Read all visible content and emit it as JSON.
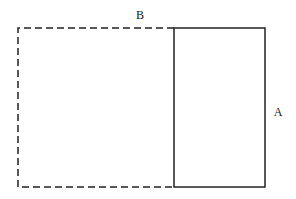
{
  "diagram": {
    "labels": {
      "top": "B",
      "right": "A"
    },
    "stroke_color": "#222222",
    "background": "#ffffff",
    "shapes": [
      {
        "id": "dashed-rectangle",
        "style": "dashed",
        "x1": 18,
        "y1": 28,
        "x2": 174,
        "y2": 187
      },
      {
        "id": "solid-rectangle",
        "style": "solid",
        "x1": 174,
        "y1": 28,
        "x2": 265,
        "y2": 187
      }
    ]
  }
}
